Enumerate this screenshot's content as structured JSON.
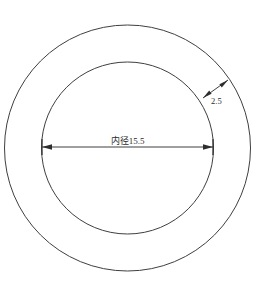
{
  "drawing": {
    "title": "annulus-cross-section",
    "background_color": "#ffffff",
    "line_color": "#3f3f3f",
    "text_color": "#2b2b2b",
    "geometry": {
      "center_x": 127.5,
      "center_y": 148,
      "outer_radius": 123,
      "inner_radius": 86
    },
    "dimensions": [
      {
        "id": "inner-diameter",
        "label": "内径15.5",
        "value": "15.5",
        "type": "diameter",
        "orientation": "horizontal",
        "from_x": 42,
        "to_x": 213,
        "line_y": 147,
        "text_x": 127.5,
        "text_y": 144
      },
      {
        "id": "wall-thickness",
        "label": "2.5",
        "value": "2.5",
        "type": "linear",
        "orientation": "diagonal",
        "from_x": 203,
        "from_y": 98,
        "to_x": 228,
        "to_y": 80,
        "text_x": 211,
        "text_y": 104
      }
    ]
  }
}
